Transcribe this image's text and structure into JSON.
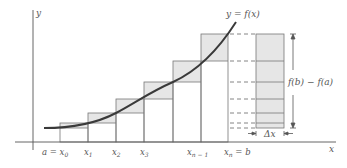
{
  "diagram": {
    "axes": {
      "x_label": "x",
      "y_label": "y"
    },
    "curve_label": "y = f(x)",
    "tick_labels": [
      {
        "main": "a = x",
        "sub": "0"
      },
      {
        "main": "x",
        "sub": "1"
      },
      {
        "main": "x",
        "sub": "2"
      },
      {
        "main": "x",
        "sub": "3"
      },
      {
        "main": "x",
        "sub": "n − 1"
      },
      {
        "main": "x",
        "sub": "n",
        "suffix": " = b"
      }
    ],
    "difference_label": "f(b) − f(a)",
    "delta_label": "Δx",
    "colors": {
      "line": "#666666",
      "curve": "#3a3a3a",
      "shade": "#e6e6e6",
      "text": "#555555"
    },
    "partition_x_px": [
      60,
      88,
      116,
      144,
      173,
      201,
      228
    ],
    "function_levels_px": [
      128,
      123,
      113,
      99,
      82,
      61,
      34
    ]
  }
}
